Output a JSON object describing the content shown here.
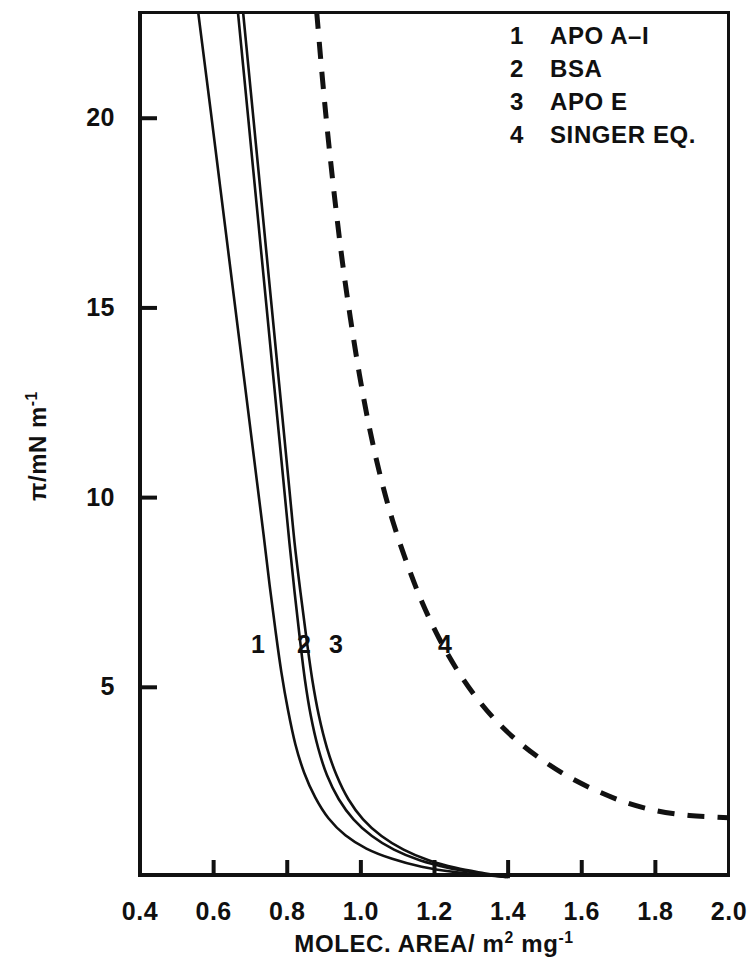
{
  "figure": {
    "background_color": "#ffffff",
    "ink_color": "#111111"
  },
  "axes": {
    "x": {
      "title_main": "MOLEC. AREA/ m",
      "title_sup1": "2",
      "title_mid": " mg",
      "title_sup2": "-1",
      "ticks": [
        "0.4",
        "0.6",
        "0.8",
        "1.0",
        "1.2",
        "1.4",
        "1.6",
        "1.8",
        "2.0"
      ],
      "min": 0.4,
      "max": 2.0
    },
    "y": {
      "title_main": "π/mN m",
      "title_sup": "-1",
      "ticks": [
        "20",
        "15",
        "10",
        "5"
      ],
      "tick_values": [
        20,
        15,
        10,
        5
      ],
      "min": 0,
      "max": 22.8
    }
  },
  "legend": {
    "entries": [
      {
        "key": "1",
        "label": "APO A–I"
      },
      {
        "key": "2",
        "label": "BSA"
      },
      {
        "key": "3",
        "label": "APO E"
      },
      {
        "key": "4",
        "label": "SINGER EQ."
      }
    ]
  },
  "curve_labels": [
    {
      "text": "1",
      "x": 246,
      "y": 632
    },
    {
      "text": "2",
      "x": 292,
      "y": 632
    },
    {
      "text": "3",
      "x": 324,
      "y": 632
    },
    {
      "text": "4",
      "x": 433,
      "y": 632
    }
  ],
  "chart_data": {
    "type": "line",
    "title": "",
    "xlabel": "MOLEC. AREA/ m2 mg-1",
    "ylabel": "π/mN m-1",
    "xlim": [
      0.4,
      2.0
    ],
    "ylim": [
      0,
      22.8
    ],
    "grid": false,
    "legend_position": "top-right",
    "xticks": [
      0.4,
      0.6,
      0.8,
      1.0,
      1.2,
      1.4,
      1.6,
      1.8,
      2.0
    ],
    "yticks": [
      5,
      10,
      15,
      20
    ],
    "series": [
      {
        "name": "APO A-I",
        "legend_key": "1",
        "style": "solid",
        "color": "#111111",
        "points": [
          [
            0.558,
            22.8
          ],
          [
            0.575,
            21.5
          ],
          [
            0.592,
            20.2
          ],
          [
            0.61,
            18.8
          ],
          [
            0.628,
            17.4
          ],
          [
            0.646,
            16.0
          ],
          [
            0.664,
            14.6
          ],
          [
            0.682,
            13.2
          ],
          [
            0.7,
            11.8
          ],
          [
            0.718,
            10.4
          ],
          [
            0.736,
            9.0
          ],
          [
            0.752,
            7.7
          ],
          [
            0.768,
            6.5
          ],
          [
            0.784,
            5.4
          ],
          [
            0.802,
            4.4
          ],
          [
            0.822,
            3.5
          ],
          [
            0.846,
            2.75
          ],
          [
            0.876,
            2.1
          ],
          [
            0.912,
            1.55
          ],
          [
            0.958,
            1.1
          ],
          [
            1.015,
            0.75
          ],
          [
            1.085,
            0.48
          ],
          [
            1.165,
            0.27
          ],
          [
            1.255,
            0.13
          ],
          [
            1.34,
            0.05
          ],
          [
            1.395,
            0.0
          ]
        ]
      },
      {
        "name": "BSA",
        "legend_key": "2",
        "style": "solid",
        "color": "#111111",
        "points": [
          [
            0.666,
            22.8
          ],
          [
            0.68,
            21.4
          ],
          [
            0.694,
            20.0
          ],
          [
            0.708,
            18.6
          ],
          [
            0.722,
            17.2
          ],
          [
            0.736,
            15.8
          ],
          [
            0.75,
            14.4
          ],
          [
            0.764,
            13.0
          ],
          [
            0.778,
            11.6
          ],
          [
            0.792,
            10.2
          ],
          [
            0.806,
            8.8
          ],
          [
            0.82,
            7.5
          ],
          [
            0.834,
            6.3
          ],
          [
            0.848,
            5.2
          ],
          [
            0.864,
            4.25
          ],
          [
            0.884,
            3.4
          ],
          [
            0.908,
            2.68
          ],
          [
            0.94,
            2.05
          ],
          [
            0.98,
            1.52
          ],
          [
            1.03,
            1.08
          ],
          [
            1.09,
            0.72
          ],
          [
            1.16,
            0.44
          ],
          [
            1.238,
            0.24
          ],
          [
            1.32,
            0.1
          ],
          [
            1.385,
            0.01
          ],
          [
            1.4,
            0.0
          ]
        ]
      },
      {
        "name": "APO E",
        "legend_key": "3",
        "style": "solid",
        "color": "#111111",
        "points": [
          [
            0.68,
            22.8
          ],
          [
            0.694,
            21.4
          ],
          [
            0.708,
            20.0
          ],
          [
            0.722,
            18.6
          ],
          [
            0.736,
            17.2
          ],
          [
            0.75,
            15.8
          ],
          [
            0.764,
            14.4
          ],
          [
            0.778,
            13.0
          ],
          [
            0.792,
            11.6
          ],
          [
            0.806,
            10.2
          ],
          [
            0.82,
            8.8
          ],
          [
            0.836,
            7.5
          ],
          [
            0.852,
            6.3
          ],
          [
            0.868,
            5.2
          ],
          [
            0.886,
            4.25
          ],
          [
            0.908,
            3.4
          ],
          [
            0.934,
            2.68
          ],
          [
            0.966,
            2.05
          ],
          [
            1.006,
            1.52
          ],
          [
            1.056,
            1.08
          ],
          [
            1.116,
            0.72
          ],
          [
            1.184,
            0.44
          ],
          [
            1.258,
            0.24
          ],
          [
            1.335,
            0.1
          ],
          [
            1.392,
            0.01
          ],
          [
            1.405,
            0.0
          ]
        ]
      },
      {
        "name": "SINGER EQ.",
        "legend_key": "4",
        "style": "dashed",
        "color": "#111111",
        "points": [
          [
            0.88,
            22.8
          ],
          [
            0.896,
            21.0
          ],
          [
            0.912,
            19.4
          ],
          [
            0.93,
            17.8
          ],
          [
            0.95,
            16.2
          ],
          [
            0.972,
            14.7
          ],
          [
            0.996,
            13.25
          ],
          [
            1.022,
            11.9
          ],
          [
            1.052,
            10.6
          ],
          [
            1.086,
            9.4
          ],
          [
            1.124,
            8.3
          ],
          [
            1.166,
            7.25
          ],
          [
            1.212,
            6.3
          ],
          [
            1.262,
            5.45
          ],
          [
            1.316,
            4.7
          ],
          [
            1.374,
            4.05
          ],
          [
            1.436,
            3.5
          ],
          [
            1.502,
            3.02
          ],
          [
            1.572,
            2.6
          ],
          [
            1.646,
            2.25
          ],
          [
            1.724,
            1.95
          ],
          [
            1.806,
            1.74
          ],
          [
            1.892,
            1.62
          ],
          [
            1.96,
            1.58
          ],
          [
            2.0,
            1.56
          ]
        ]
      }
    ]
  }
}
